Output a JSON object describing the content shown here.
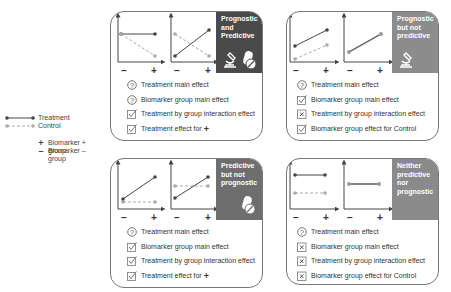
{
  "legend": {
    "treatment_label": "Treatment",
    "control_label": "Control",
    "plus_symbol": "+",
    "minus_symbol": "–",
    "biomarker_plus_label": "Biomarker + group",
    "biomarker_minus_label": "Biomarker – group"
  },
  "axis_labels": {
    "minus": "–",
    "plus": "+"
  },
  "panels": [
    {
      "id": "prognostic-and-predictive",
      "title_lines": [
        "Prognostic",
        "and",
        "Predictive"
      ],
      "header_color": "#4a4a4a",
      "icons": [
        "microscope-icon",
        "pill-icon"
      ],
      "items": [
        {
          "icon": "question",
          "text": "Treatment main effect"
        },
        {
          "icon": "check",
          "text": "Biomarker group main effect",
          "icon_actual": "question"
        },
        {
          "icon": "check",
          "text": "Treatment by group interaction effect"
        },
        {
          "icon": "check",
          "text": "Treatment effect for",
          "suffix": "+"
        }
      ]
    },
    {
      "id": "prognostic-not-predictive",
      "title_lines": [
        "Prognostic",
        "but not",
        "predictive"
      ],
      "header_color": "#8c8c8c",
      "icons": [
        "microscope-icon"
      ],
      "items": [
        {
          "icon": "question",
          "text": "Treatment main effect"
        },
        {
          "icon": "check",
          "text": "Biomarker group main effect"
        },
        {
          "icon": "cross",
          "text": "Treatment by group interaction effect"
        },
        {
          "icon": "check",
          "text": "Biomarker group effect for Control"
        }
      ]
    },
    {
      "id": "predictive-not-prognostic",
      "title_lines": [
        "Predictive",
        "but not",
        "prognostic"
      ],
      "header_color": "#6e6e6e",
      "icons": [
        "pill-icon"
      ],
      "items": [
        {
          "icon": "question",
          "text": "Treatment main effect"
        },
        {
          "icon": "check",
          "text": "Biomarker group main effect"
        },
        {
          "icon": "check",
          "text": "Treatment by group interaction effect"
        },
        {
          "icon": "check",
          "text": "Treatment effect for",
          "suffix": "+"
        }
      ]
    },
    {
      "id": "neither",
      "title_lines": [
        "Neither",
        "predictive",
        "nor",
        "prognostic"
      ],
      "header_color": "#8a8a8a",
      "icons": [],
      "items": [
        {
          "icon": "question",
          "text": "Treatment main effect"
        },
        {
          "icon": "cross",
          "text": "Biomarker group main effect"
        },
        {
          "icon": "cross",
          "text": "Treatment by group interaction effect"
        },
        {
          "icon": "cross",
          "text": "Biomarker group effect for Control"
        }
      ]
    }
  ]
}
